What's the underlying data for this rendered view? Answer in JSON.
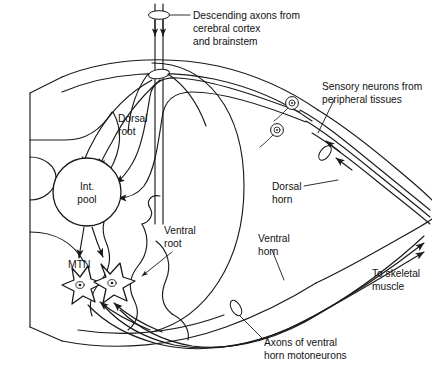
{
  "figure": {
    "type": "anatomical-line-diagram",
    "background_color": "#ffffff",
    "ink_color": "#1a1a1a"
  },
  "labels": {
    "descending_axons": {
      "line1": "Descending axons from",
      "line2": "cerebral cortex",
      "line3": "and brainstem"
    },
    "sensory_neurons": {
      "line1": "Sensory neurons from",
      "line2": "peripheral tissues"
    },
    "dorsal_root": {
      "line1": "Dorsal",
      "line2": "root"
    },
    "ventral_root": {
      "line1": "Ventral",
      "line2": "root"
    },
    "dorsal_horn": {
      "line1": "Dorsal",
      "line2": "horn"
    },
    "ventral_horn": {
      "line1": "Ventral",
      "line2": "horn"
    },
    "to_skeletal_muscle": {
      "line1": "To skeletal",
      "line2": "muscle"
    },
    "axons_ventral_horn": {
      "line1": "Axons of ventral",
      "line2": "horn motoneurons"
    },
    "interneuron_pool": {
      "line1": "Int.",
      "line2": "pool"
    },
    "motoneurons": {
      "text": "MTN"
    }
  },
  "structures": {
    "cord_body": "spinal-cord-segment",
    "gray_matter": "butterfly-gray-matter",
    "interneuron_pool_shape": "circle",
    "motoneuron_count": 2,
    "dorsal_root_ganglion_count": 2,
    "descending_axon_count": 2,
    "sensory_axon_count": 3,
    "motor_axon_count": 3
  }
}
